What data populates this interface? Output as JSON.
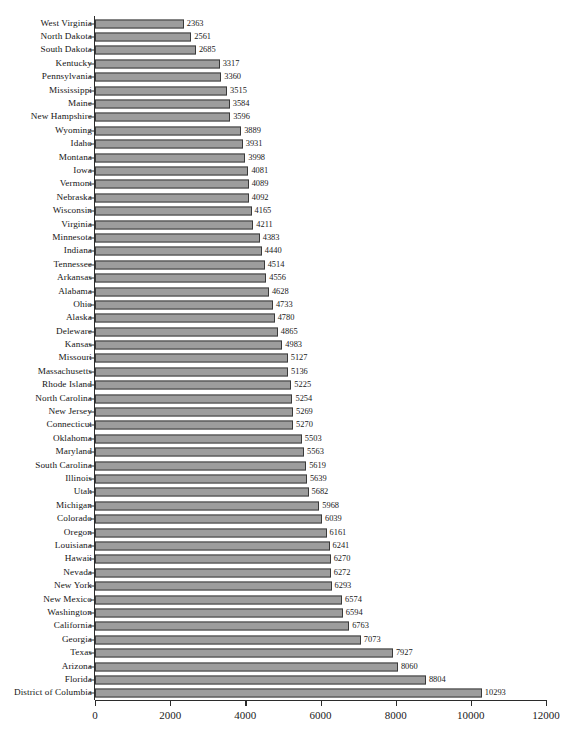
{
  "chart_data": {
    "type": "bar",
    "orientation": "horizontal",
    "title": "",
    "subtitle": "",
    "xlabel": "",
    "ylabel": "",
    "xlim": [
      0,
      12000
    ],
    "xticks": [
      0,
      2000,
      4000,
      6000,
      8000,
      10000,
      12000
    ],
    "xtick_labels": [
      "0",
      "2000",
      "4000",
      "6000",
      "8000",
      "10000",
      "12000"
    ],
    "grid": false,
    "legend": null,
    "data_labels": true,
    "bar_fill_color": "#9d9d9d",
    "bar_border_color": "#3a3a3a",
    "axis_color": "#2b2b2b",
    "categories": [
      "West Virginia",
      "North Dakota",
      "South Dakota",
      "Kentucky",
      "Pennsylvania",
      "Mississippi",
      "Maine",
      "New Hampshire",
      "Wyoming",
      "Idaho",
      "Montana",
      "Iowa",
      "Vermont",
      "Nebraska",
      "Wisconsin",
      "Virginia",
      "Minnesota",
      "Indiana",
      "Tennessee",
      "Arkansas",
      "Alabama",
      "Ohio",
      "Alaska",
      "Deleware",
      "Kansas",
      "Missouri",
      "Massachusetts",
      "Rhode Island",
      "North Carolina",
      "New Jersey",
      "Connecticut",
      "Oklahoma",
      "Maryland",
      "South Carolina",
      "Illinois",
      "Utah",
      "Michigan",
      "Colorado",
      "Oregon",
      "Louisiana",
      "Hawaii",
      "Nevada",
      "New York",
      "New Mexico",
      "Washington",
      "California",
      "Georgia",
      "Texas",
      "Arizona",
      "Florida",
      "District of Columbia"
    ],
    "values": [
      2363,
      2561,
      2685,
      3317,
      3360,
      3515,
      3584,
      3596,
      3889,
      3931,
      3998,
      4081,
      4089,
      4092,
      4165,
      4211,
      4383,
      4440,
      4514,
      4556,
      4628,
      4733,
      4780,
      4865,
      4983,
      5127,
      5136,
      5225,
      5254,
      5269,
      5270,
      5503,
      5563,
      5619,
      5639,
      5682,
      5968,
      6039,
      6161,
      6241,
      6270,
      6272,
      6293,
      6574,
      6594,
      6763,
      7073,
      7927,
      8060,
      8804,
      10293
    ]
  },
  "caption": ""
}
